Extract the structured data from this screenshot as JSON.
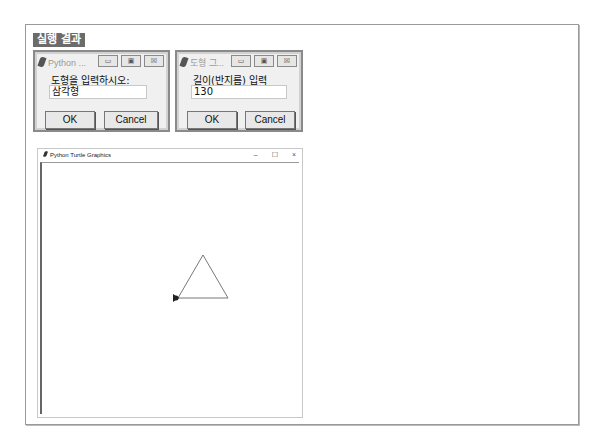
{
  "section_label": "실행 결과",
  "dialog1": {
    "title": "Python ...",
    "prompt": "도형을 입력하시오:",
    "input_value": "삼각형",
    "ok_label": "OK",
    "cancel_label": "Cancel",
    "controls": {
      "minimize": "▭",
      "maximize": "▣",
      "close": "☒"
    }
  },
  "dialog2": {
    "title": "도형 그...",
    "prompt": "길이(반지름) 입력",
    "input_value": "130",
    "ok_label": "OK",
    "cancel_label": "Cancel",
    "controls": {
      "minimize": "▭",
      "maximize": "▣",
      "close": "☒"
    }
  },
  "turtle_window": {
    "title": "Python Turtle Graphics",
    "controls": {
      "minimize": "–",
      "maximize": "☐",
      "close": "×"
    },
    "drawing": {
      "shape": "triangle",
      "size": 130,
      "line_color": "#555555",
      "turtle_color": "#222222"
    }
  }
}
